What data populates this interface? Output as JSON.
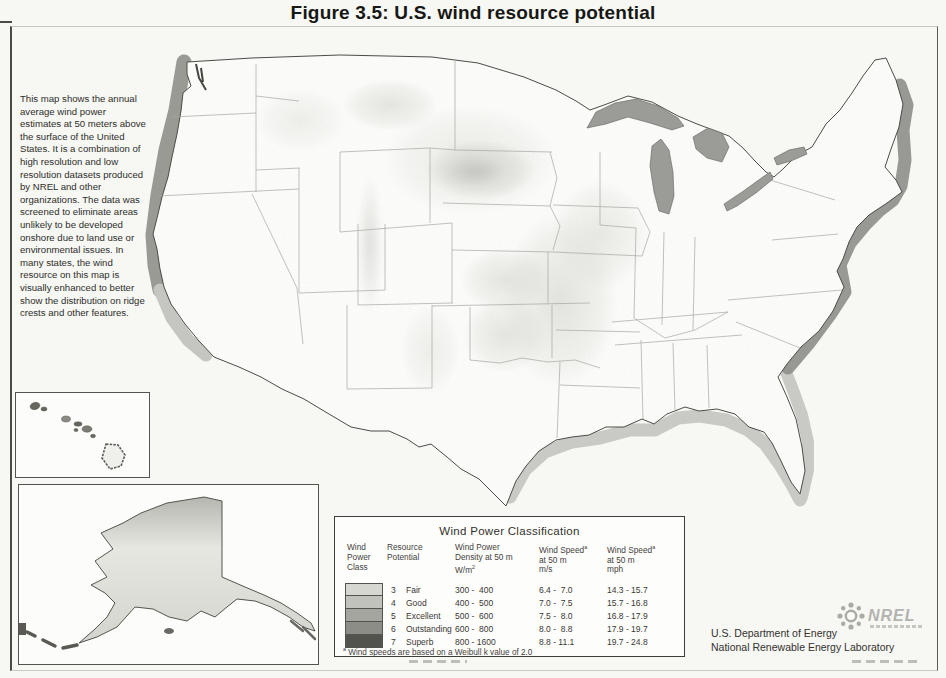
{
  "figure": {
    "title": "Figure 3.5:  U.S. wind resource potential"
  },
  "sidebar": {
    "description": "This map shows the annual average wind power estimates at 50 meters above the surface of the United States.  It is a combination of high resolution and low resolution datasets produced by NREL and other organizations.  The data was screened to eliminate areas unlikely to be developed onshore due to land use or environmental issues.  In many states, the wind resource on this map is visually enhanced to better show the distribution on ridge crests and other features."
  },
  "legend": {
    "title": "Wind Power Classification",
    "headers": [
      [
        "Wind",
        "Power",
        "Class"
      ],
      [
        "Resource",
        "Potential"
      ],
      [
        "Wind Power",
        "Density at 50 m",
        "W/m^2"
      ],
      [
        "Wind Speed^a",
        "at 50 m",
        "m/s"
      ],
      [
        "Wind Speed^a",
        "at 50 m",
        "mph"
      ]
    ],
    "rows": [
      {
        "class": "3",
        "potential": "Fair",
        "density": "300 -  400",
        "speed_ms": "6.4 -  7.0",
        "speed_mph": "14.3 - 15.7",
        "color": "#d7d7d2"
      },
      {
        "class": "4",
        "potential": "Good",
        "density": "400 -  500",
        "speed_ms": "7.0 -  7.5",
        "speed_mph": "15.7 - 16.8",
        "color": "#c2c2bd"
      },
      {
        "class": "5",
        "potential": "Excellent",
        "density": "500 -  600",
        "speed_ms": "7.5 -  8.0",
        "speed_mph": "16.8 - 17.9",
        "color": "#a5a5a0"
      },
      {
        "class": "6",
        "potential": "Outstanding",
        "density": "600 -  800",
        "speed_ms": "8.0 -  8.8",
        "speed_mph": "17.9 - 19.7",
        "color": "#8d8d88"
      },
      {
        "class": "7",
        "potential": "Superb",
        "density": "800 - 1600",
        "speed_ms": "8.8 - 11.1",
        "speed_mph": "19.7 - 24.8",
        "color": "#53534e"
      }
    ],
    "footnote": "^a Wind speeds are based on a Weibull k value of 2.0"
  },
  "attribution": {
    "line1": "U.S. Department of Energy",
    "line2": "National Renewable Energy Laboratory"
  },
  "logo": {
    "text": "NREL"
  }
}
